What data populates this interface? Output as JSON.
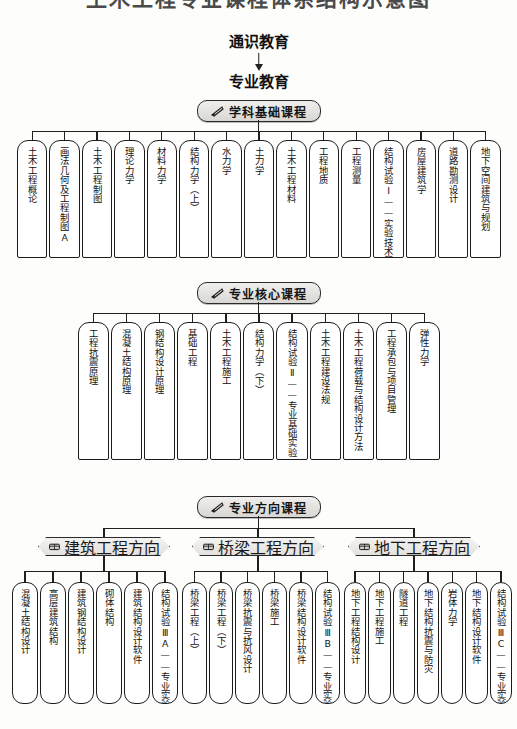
{
  "title_cropped": "土木工程专业课程体系结构示意图",
  "top_flow": {
    "general_education": "通识教育",
    "major_education": "专业教育",
    "arrow_icon": "arrow-down-icon"
  },
  "sections": [
    {
      "id": "discipline-foundation",
      "header": "学科基础课程",
      "header_icon": "pen-nib-icon",
      "courses": [
        "土木工程概论",
        "画法几何及工程制图A",
        "土木工程制图",
        "理论力学",
        "材料力学",
        "结构力学（上）",
        "水力学",
        "土力学",
        "土木工程材料",
        "工程地质",
        "工程测量",
        "结构试验Ⅰ——实验技术基础",
        "房屋建筑学",
        "道路勘测设计",
        "地下空间建筑与规划"
      ]
    },
    {
      "id": "major-core",
      "header": "专业核心课程",
      "header_icon": "pen-nib-icon",
      "courses": [
        "工程抗震原理",
        "混凝土结构原理",
        "钢结构设计原理",
        "基础工程",
        "土木工程施工",
        "结构力学（下）",
        "结构试验Ⅱ——专业基础实验",
        "土木工程建设法规",
        "土木工程荷载与结构设计方法",
        "工程承包与项目管理",
        "弹性力学"
      ]
    },
    {
      "id": "major-direction",
      "header": "专业方向课程",
      "header_icon": "pen-nib-icon",
      "branches": [
        {
          "id": "building-engineering",
          "label": "建筑工程方向",
          "icon": "book-icon",
          "courses": [
            "混凝土结构设计",
            "高层建筑结构",
            "建筑钢结构设计",
            "砌体结构",
            "建筑结构设计软件",
            "结构试验ⅢA——专业实验"
          ]
        },
        {
          "id": "bridge-engineering",
          "label": "桥梁工程方向",
          "icon": "book-icon",
          "courses": [
            "桥梁工程（上）",
            "桥梁工程（下）",
            "桥梁抗震与抗风设计",
            "桥梁施工",
            "桥梁结构设计软件",
            "结构试验ⅢB——专业实验"
          ]
        },
        {
          "id": "underground-engineering",
          "label": "地下工程方向",
          "icon": "book-icon",
          "courses": [
            "地下工程结构设计",
            "地下工程施工",
            "隧道工程",
            "地下结构抗震与防灾",
            "岩体力学",
            "地下结构设计软件",
            "结构试验ⅢC——专业实验"
          ]
        }
      ]
    }
  ],
  "colors": {
    "line": "#1f1f1f",
    "box_border": "#1c1c1c",
    "box_fill": "#ffffff",
    "pill_fill": "#e6e4e0",
    "page_bg": "#fdfdfc"
  }
}
